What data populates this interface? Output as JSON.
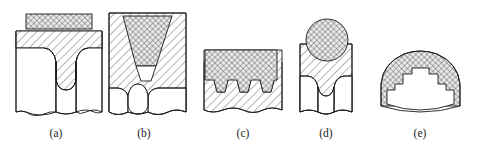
{
  "figure": {
    "background_color": "#ffffff",
    "line_color": "#1a1a1a",
    "base_hatch_fill": "#ffffff",
    "insert_hatch_fill": "#e8e8e8",
    "width": 485,
    "height": 145
  },
  "panels": [
    {
      "id": "a",
      "label": "(a)",
      "label_x": 56,
      "label_y": 137,
      "description": "Butt joint with flat rectangular cross-hatched insert strip on top and rounded weld root penetrating between two base members",
      "insert_shape": "rectangular-strip",
      "base_members": 2,
      "has_break_line": true
    },
    {
      "id": "b",
      "label": "(b)",
      "label_x": 144,
      "label_y": 137,
      "description": "Single-V groove joint with trapezoidal cross-hatched filler wedge tapering downward into the base material, rounded root",
      "insert_shape": "trapezoid-wedge",
      "base_members": 2,
      "has_break_line": true
    },
    {
      "id": "c",
      "label": "(c)",
      "label_x": 243,
      "label_y": 137,
      "description": "Multi-tab joint with cross-hatched overlay cap filling three trapezoidal grooves between base tabs",
      "insert_shape": "capped-multi-groove",
      "groove_count": 3,
      "base_members": 1,
      "has_break_line": true
    },
    {
      "id": "d",
      "label": "(d)",
      "label_x": 326,
      "label_y": 137,
      "description": "Joint with circular cross-hatched insert seated on top of base block, rounded weld root below",
      "insert_shape": "circle",
      "base_members": 2,
      "has_break_line": true
    },
    {
      "id": "e",
      "label": "(e)",
      "label_x": 420,
      "label_y": 137,
      "description": "Curved arch section with cross-hatched outer band and castellated stepped inner profile",
      "insert_shape": "curved-castellated-band",
      "step_count": 4,
      "base_members": 1,
      "has_break_line": false
    }
  ]
}
